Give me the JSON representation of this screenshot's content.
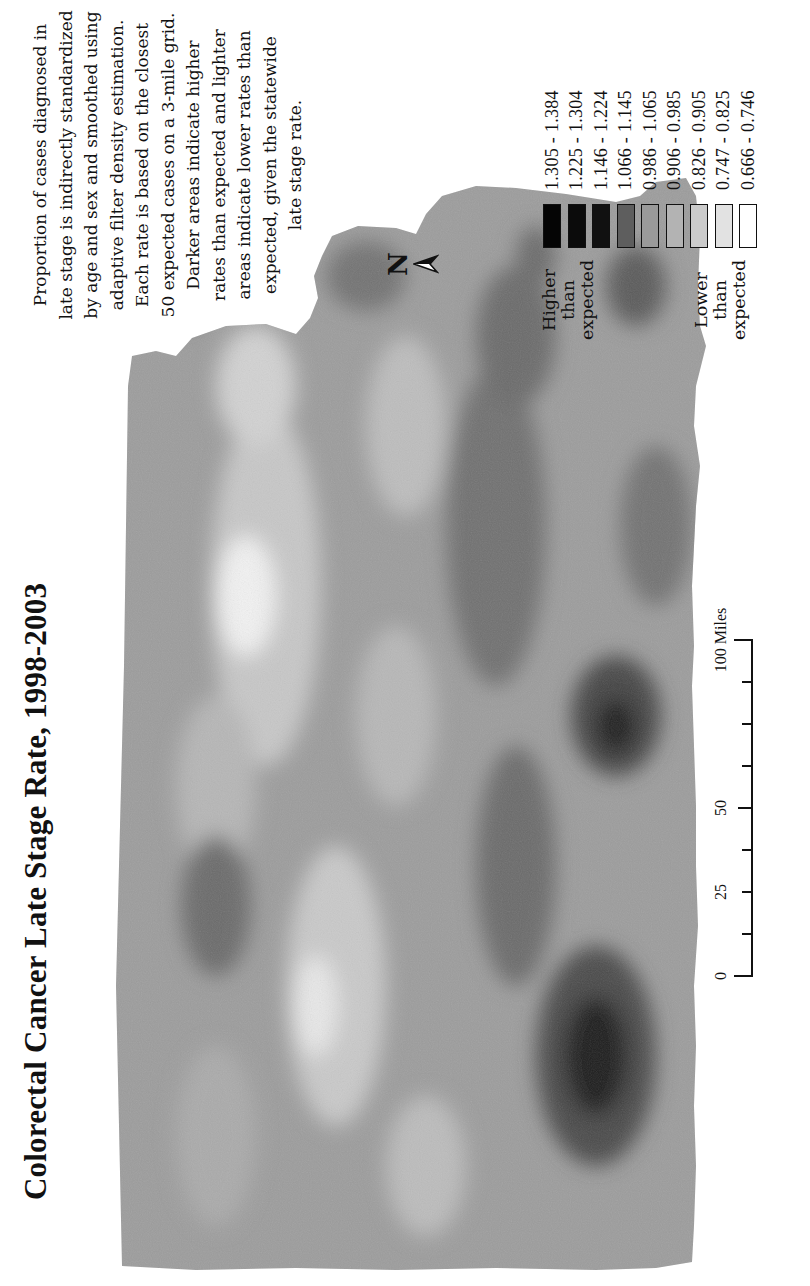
{
  "title": "Colorectal Cancer Late Stage Rate, 1998-2003",
  "description": {
    "lines": [
      "Proportion of cases diagnosed in",
      "late stage is indirectly standardized",
      "by age and sex and smoothed using",
      "adaptive filter density estimation.",
      "Each rate is based on the closest",
      "50 expected cases on a 3-mile grid.",
      "Darker areas indicate higher",
      "rates than expected and lighter",
      "areas indicate lower rates than",
      "expected, given the statewide",
      "late stage rate."
    ]
  },
  "north_arrow": {
    "label": "N",
    "icon": "north-arrow-icon"
  },
  "legend": {
    "higher_label": [
      "Higher",
      "than",
      "expected"
    ],
    "lower_label": [
      "Lower",
      "than",
      "expected"
    ],
    "classes": [
      {
        "range": "1.305 - 1.384",
        "color": "#050505"
      },
      {
        "range": "1.225 - 1.304",
        "color": "#0b0b0b"
      },
      {
        "range": "1.146 - 1.224",
        "color": "#111111"
      },
      {
        "range": "1.066 - 1.145",
        "color": "#5e5e5e"
      },
      {
        "range": "0.986 - 1.065",
        "color": "#9a9a9a"
      },
      {
        "range": "0.906 - 0.985",
        "color": "#b3b3b3"
      },
      {
        "range": "0.826 - 0.905",
        "color": "#cbcbcb"
      },
      {
        "range": "0.747 - 0.825",
        "color": "#e2e2e2"
      },
      {
        "range": "0.666 - 0.746",
        "color": "#ffffff"
      }
    ]
  },
  "scale_bar": {
    "ticks": [
      "0",
      "25",
      "50",
      "100 Miles"
    ],
    "unit": "Miles"
  },
  "chart_data": {
    "type": "heatmap",
    "title": "Colorectal Cancer Late Stage Rate, 1998-2003",
    "legend_title": "Late stage rate ratio (observed/expected)",
    "classes": [
      "1.305 - 1.384",
      "1.225 - 1.304",
      "1.146 - 1.224",
      "1.066 - 1.145",
      "0.986 - 1.065",
      "0.906 - 0.985",
      "0.826 - 0.905",
      "0.747 - 0.825",
      "0.666 - 0.746"
    ],
    "legend_position": "right",
    "scale": "0-100 Miles",
    "grid": false
  }
}
